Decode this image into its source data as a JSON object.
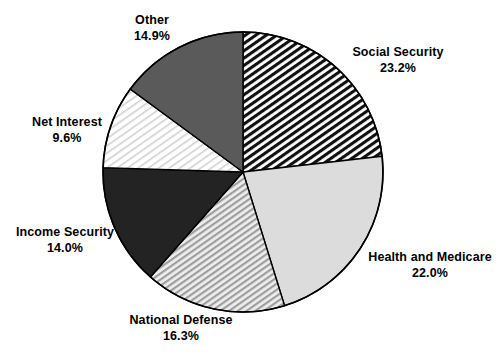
{
  "chart_data": {
    "type": "pie",
    "title": "",
    "xlabel": "",
    "ylabel": "",
    "units": "percent",
    "legend_position": "none",
    "grid": false,
    "labels_show_name_and_percent": true,
    "start_angle_deg": 0,
    "direction": "clockwise",
    "categories": [
      "Social Security",
      "Health and Medicare",
      "National Defense",
      "Income Security",
      "Net Interest",
      "Other"
    ],
    "values": [
      23.2,
      22.0,
      16.3,
      14.0,
      9.6,
      14.9
    ],
    "slices": [
      {
        "name": "Social Security",
        "value": 23.2,
        "percent_label": "23.2%",
        "fill_style": "dense-diagonal-hatch",
        "fill_color": "#ffffff",
        "hatch_color": "#111111"
      },
      {
        "name": "Health and Medicare",
        "value": 22.0,
        "percent_label": "22.0%",
        "fill_style": "solid",
        "fill_color": "#dcdcdc",
        "hatch_color": ""
      },
      {
        "name": "National Defense",
        "value": 16.3,
        "percent_label": "16.3%",
        "fill_style": "light-diagonal-hatch",
        "fill_color": "#e8e8e8",
        "hatch_color": "#9a9a9a"
      },
      {
        "name": "Income Security",
        "value": 14.0,
        "percent_label": "14.0%",
        "fill_style": "solid",
        "fill_color": "#232323",
        "hatch_color": ""
      },
      {
        "name": "Net Interest",
        "value": 9.6,
        "percent_label": "9.6%",
        "fill_style": "sparse-diagonal-hatch",
        "fill_color": "#ffffff",
        "hatch_color": "#c8c8c8"
      },
      {
        "name": "Other",
        "value": 14.9,
        "percent_label": "14.9%",
        "fill_style": "solid",
        "fill_color": "#5a5a5a",
        "hatch_color": ""
      }
    ],
    "geometry": {
      "center_x": 243,
      "center_y": 172,
      "radius": 140,
      "outline_color": "#000000"
    }
  },
  "labels": {
    "social_security": {
      "name": "Social Security",
      "percent": "23.2%"
    },
    "health_medicare": {
      "name": "Health and Medicare",
      "percent": "22.0%"
    },
    "national_defense": {
      "name": "National Defense",
      "percent": "16.3%"
    },
    "income_security": {
      "name": "Income Security",
      "percent": "14.0%"
    },
    "net_interest": {
      "name": "Net Interest",
      "percent": "9.6%"
    },
    "other": {
      "name": "Other",
      "percent": "14.9%"
    }
  }
}
